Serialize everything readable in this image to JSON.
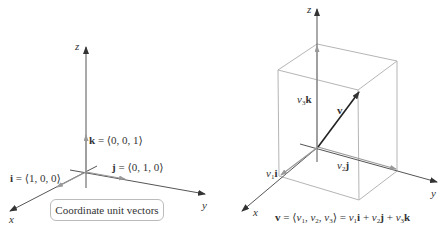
{
  "left_figure": {
    "caption": "Coordinate unit vectors",
    "axes": {
      "x": "x",
      "y": "y",
      "z": "z"
    },
    "vectors": {
      "i": {
        "name": "i",
        "eq": " = ⟨1, 0, 0⟩"
      },
      "j": {
        "name": "j",
        "eq": " = ⟨0, 1, 0⟩"
      },
      "k": {
        "name": "k",
        "eq": " = ⟨0, 0, 1⟩"
      }
    }
  },
  "right_figure": {
    "axes": {
      "x": "x",
      "y": "y",
      "z": "z"
    },
    "vector_label": "v",
    "components": {
      "v1i": {
        "coef": "v",
        "sub": "1",
        "unit": "i"
      },
      "v2j": {
        "coef": "v",
        "sub": "2",
        "unit": "j"
      },
      "v3k": {
        "coef": "v",
        "sub": "3",
        "unit": "k"
      }
    },
    "formula": {
      "lhs": "v",
      "eq1": " = ⟨",
      "c1": "v",
      "s1": "1",
      "comma1": ", ",
      "c2": "v",
      "s2": "2",
      "comma2": ", ",
      "c3": "v",
      "s3": "3",
      "eq2": "⟩ = ",
      "t1c": "v",
      "t1s": "1",
      "t1u": "i",
      "plus1": " + ",
      "t2c": "v",
      "t2s": "2",
      "t2u": "j",
      "plus2": " + ",
      "t3c": "v",
      "t3s": "3",
      "t3u": "k"
    }
  },
  "colors": {
    "axis": "#444444",
    "unit_vector": "#999999",
    "box": "#b0b0b0",
    "vector": "#222222"
  }
}
